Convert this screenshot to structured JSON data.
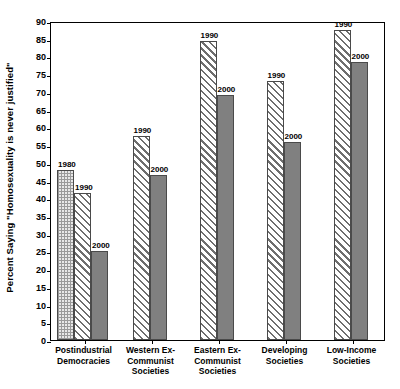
{
  "chart_data": {
    "type": "bar",
    "title": "",
    "xlabel": "",
    "ylabel": "Percent Saying \"Homosexuality is never justified\"",
    "ylim": [
      0,
      90
    ],
    "ytick_step": 5,
    "yticks": [
      0,
      5,
      10,
      15,
      20,
      25,
      30,
      35,
      40,
      45,
      50,
      55,
      60,
      65,
      70,
      75,
      80,
      85,
      90
    ],
    "grid": false,
    "legend_position": "none",
    "categories": [
      "Postindustrial\nDemocracies",
      "Western Ex-\nCommunist\nSocieties",
      "Eastern Ex-\nCommunist\nSocieties",
      "Developing\nSocieties",
      "Low-Income\nSocieties"
    ],
    "series": [
      {
        "name": "1980",
        "fill": "stipple",
        "values": [
          48,
          null,
          null,
          null,
          null
        ]
      },
      {
        "name": "1990",
        "fill": "hatch",
        "values": [
          41.5,
          57.5,
          84.5,
          73,
          87.5
        ]
      },
      {
        "name": "2000",
        "fill": "solid-gray",
        "values": [
          25,
          46.5,
          69,
          56,
          78.5
        ]
      }
    ]
  },
  "axis": {
    "ticks": [
      "90",
      "85",
      "80",
      "75",
      "70",
      "65",
      "60",
      "55",
      "50",
      "45",
      "40",
      "35",
      "30",
      "25",
      "20",
      "15",
      "10",
      "5",
      "0"
    ],
    "title": "Percent Saying \"Homosexuality is never justified\""
  },
  "groups": [
    {
      "label_lines": [
        "Postindustrial",
        "Democracies"
      ],
      "bars": [
        {
          "year": "1980",
          "value": 48,
          "fill": "p1980"
        },
        {
          "year": "1990",
          "value": 41.5,
          "fill": "p1990"
        },
        {
          "year": "2000",
          "value": 25,
          "fill": "p2000"
        }
      ]
    },
    {
      "label_lines": [
        "Western Ex-",
        "Communist",
        "Societies"
      ],
      "bars": [
        {
          "year": "1990",
          "value": 57.5,
          "fill": "p1990"
        },
        {
          "year": "2000",
          "value": 46.5,
          "fill": "p2000"
        }
      ]
    },
    {
      "label_lines": [
        "Eastern Ex-",
        "Communist",
        "Societies"
      ],
      "bars": [
        {
          "year": "1990",
          "value": 84.5,
          "fill": "p1990"
        },
        {
          "year": "2000",
          "value": 69,
          "fill": "p2000"
        }
      ]
    },
    {
      "label_lines": [
        "Developing",
        "Societies"
      ],
      "bars": [
        {
          "year": "1990",
          "value": 73,
          "fill": "p1990"
        },
        {
          "year": "2000",
          "value": 56,
          "fill": "p2000"
        }
      ]
    },
    {
      "label_lines": [
        "Low-Income",
        "Societies"
      ],
      "bars": [
        {
          "year": "1990",
          "value": 87.5,
          "fill": "p1990"
        },
        {
          "year": "2000",
          "value": 78.5,
          "fill": "p2000"
        }
      ]
    }
  ],
  "colors": {
    "axis": "#000000",
    "bar_solid": "#808080",
    "bar_hatch_line": "#6e6e6e",
    "bar_stipple_bg": "#e8e8e8",
    "background": "#ffffff"
  }
}
